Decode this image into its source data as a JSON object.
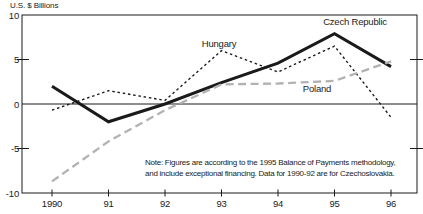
{
  "title": "U.S. $ Billions",
  "note": {
    "line1": "Note: Figures are according to the 1995 Balance of Payments methodology,",
    "line2": "and include exceptional financing. Data for 1990-92 are for Czechoslovakia."
  },
  "chart_data": {
    "type": "line",
    "title": "",
    "ylabel": "U.S. $ Billions",
    "xlabel": "",
    "categories": [
      "1990",
      "91",
      "92",
      "93",
      "94",
      "95",
      "96"
    ],
    "ylim": [
      -10,
      10
    ],
    "yticks": [
      10,
      5,
      0,
      -5,
      -10
    ],
    "grid": false,
    "legend_position": "inline-labels",
    "series": [
      {
        "name": "Czech Republic",
        "values": [
          2.0,
          -2.0,
          0.0,
          2.4,
          4.6,
          7.9,
          4.2
        ],
        "color": "#1a1a1a",
        "style": "solid",
        "width": 3
      },
      {
        "name": "Hungary",
        "values": [
          -0.7,
          1.5,
          0.4,
          6.0,
          3.6,
          6.5,
          -1.5
        ],
        "color": "#1a1a1a",
        "style": "short-dash",
        "width": 1.4
      },
      {
        "name": "Poland",
        "values": [
          -8.7,
          -4.2,
          -0.7,
          2.2,
          2.3,
          2.6,
          4.8
        ],
        "color": "#b2b2b2",
        "style": "dash",
        "width": 2.3
      }
    ]
  }
}
